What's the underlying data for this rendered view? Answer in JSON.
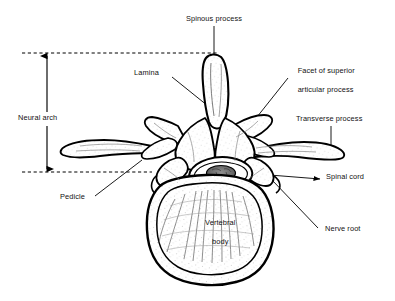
{
  "figure": {
    "background_color": "#ffffff",
    "line_color": "#000000",
    "text_color": "#111111"
  },
  "labels": {
    "spinous_process": "Spinous process",
    "lamina": "Lamina",
    "facet_superior_articular": "Facet of superior\narticular process",
    "facet_line1": "Facet of superior",
    "facet_line2": "articular process",
    "transverse_process": "Transverse process",
    "neural_arch": "Neural arch",
    "pedicle": "Pedicle",
    "spinal_cord": "Spinal cord",
    "nerve_root": "Nerve root",
    "vertebral_body": "Vertebral\nbody",
    "vertebral_body_line1": "Vertebral",
    "vertebral_body_line2": "body"
  },
  "annotations": [
    {
      "name": "spinous-process",
      "text": "Spinous process",
      "leader": "vertical-down"
    },
    {
      "name": "lamina",
      "text": "Lamina",
      "leader": "diagonal-down-right"
    },
    {
      "name": "facet-of-superior-articular-process",
      "text": "Facet of superior articular process",
      "leader": "diagonal-down-left"
    },
    {
      "name": "transverse-process",
      "text": "Transverse process",
      "leader": "vertical-down"
    },
    {
      "name": "neural-arch",
      "text": "Neural arch",
      "leader": "double-arrow-vertical"
    },
    {
      "name": "pedicle",
      "text": "Pedicle",
      "leader": "diagonal-up-right"
    },
    {
      "name": "spinal-cord",
      "text": "Spinal cord",
      "leader": "horizontal-left"
    },
    {
      "name": "nerve-root",
      "text": "Nerve root",
      "leader": "diagonal-up-left"
    },
    {
      "name": "vertebral-body",
      "text": "Vertebral body",
      "leader": "none"
    }
  ],
  "guides": {
    "upper_dashed_y": 53,
    "lower_dashed_y": 172,
    "arrow_x": 47
  }
}
